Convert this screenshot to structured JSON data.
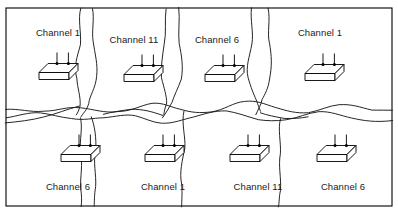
{
  "figure": {
    "frame": {
      "x": 6,
      "y": 8,
      "width": 386,
      "height": 198,
      "stroke_color": "#000000"
    },
    "colors": {
      "line": "#1a1a1a",
      "frame": "#000000",
      "background": "#ffffff",
      "text": "#1a1a1a"
    },
    "icon_name": "wireless-access-point-icon",
    "cells": [
      {
        "id": "cell-top-1",
        "row": "top",
        "column": 1,
        "label": "Channel 1",
        "channel": 1,
        "label_x": 58,
        "label_y": 36,
        "ap_x": 54,
        "ap_y": 76
      },
      {
        "id": "cell-top-2",
        "row": "top",
        "column": 2,
        "label": "Channel 11",
        "channel": 11,
        "label_x": 134,
        "label_y": 43,
        "ap_x": 139,
        "ap_y": 78
      },
      {
        "id": "cell-top-3",
        "row": "top",
        "column": 3,
        "label": "Channel 6",
        "channel": 6,
        "label_x": 217,
        "label_y": 43,
        "ap_x": 220,
        "ap_y": 78
      },
      {
        "id": "cell-top-4",
        "row": "top",
        "column": 4,
        "label": "Channel 1",
        "channel": 1,
        "label_x": 320,
        "label_y": 36,
        "ap_x": 320,
        "ap_y": 77
      },
      {
        "id": "cell-bottom-1",
        "row": "bottom",
        "column": 1,
        "label": "Channel 6",
        "channel": 6,
        "label_x": 68,
        "label_y": 190,
        "ap_x": 76,
        "ap_y": 158
      },
      {
        "id": "cell-bottom-2",
        "row": "bottom",
        "column": 2,
        "label": "Channel 1",
        "channel": 1,
        "label_x": 163,
        "label_y": 190,
        "ap_x": 160,
        "ap_y": 158
      },
      {
        "id": "cell-bottom-3",
        "row": "bottom",
        "column": 3,
        "label": "Channel 11",
        "channel": 11,
        "label_x": 258,
        "label_y": 190,
        "ap_x": 245,
        "ap_y": 158
      },
      {
        "id": "cell-bottom-4",
        "row": "bottom",
        "column": 4,
        "label": "Channel 6",
        "channel": 6,
        "label_x": 343,
        "label_y": 190,
        "ap_x": 332,
        "ap_y": 158
      }
    ],
    "boundaries": [
      {
        "id": "divider-horizontal-main",
        "orientation": "horizontal",
        "path": "M 6 110 C 20 108, 30 112, 44 111 C 58 110, 66 106, 80 108 C 95 110, 104 113, 118 112 C 132 111, 140 105, 152 104 C 163 103, 170 108, 180 110 C 192 112, 200 114, 212 112 C 224 110, 232 103, 244 101 C 256 99, 264 104, 276 107 C 288 110, 296 113, 308 112 C 320 111, 328 106, 340 105 C 352 104, 360 108, 372 110 C 381 111, 387 111, 392 110"
      },
      {
        "id": "divider-horizontal-secondary",
        "orientation": "horizontal",
        "path": "M 6 118 C 18 116, 28 112, 40 113 C 52 114, 60 118, 72 119 C 84 120, 92 118, 104 117 C 116 116, 126 114, 136 116 C 146 118, 152 122, 162 123 C 174 124, 182 120, 194 117 C 206 114, 214 110, 226 111 C 238 112, 246 117, 258 119 C 268 121, 276 122, 286 120 C 298 118, 306 113, 318 112 C 330 111, 340 115, 352 118 C 364 121, 376 122, 392 120"
      },
      {
        "id": "divider-vertical-top-a1",
        "orientation": "vertical",
        "path": "M 80 8 C 78 20, 82 32, 80 44 C 78 56, 74 66, 76 78 C 78 88, 82 96, 80 106 C 79 110, 78 112, 77 115"
      },
      {
        "id": "divider-vertical-top-a2",
        "orientation": "vertical",
        "path": "M 93 8 C 95 20, 91 30, 93 42 C 95 54, 99 64, 97 76 C 95 88, 90 96, 88 104 C 86 110, 83 114, 80 118"
      },
      {
        "id": "divider-vertical-top-b1",
        "orientation": "vertical",
        "path": "M 166 8 C 164 20, 167 32, 165 44 C 163 56, 160 66, 162 78 C 164 88, 167 96, 166 104 C 165 109, 164 112, 163 115"
      },
      {
        "id": "divider-vertical-top-b2",
        "orientation": "vertical",
        "path": "M 178 8 C 180 20, 177 32, 179 44 C 181 56, 184 66, 181 78 C 178 88, 174 96, 171 103 C 169 108, 166 113, 163 117"
      },
      {
        "id": "divider-vertical-top-c1",
        "orientation": "vertical",
        "path": "M 252 8 C 250 20, 253 32, 251 44 C 249 56, 246 66, 248 78 C 250 88, 254 94, 256 100 C 258 105, 259 108, 260 112"
      },
      {
        "id": "divider-vertical-top-c2",
        "orientation": "vertical",
        "path": "M 268 8 C 270 20, 267 32, 269 44 C 271 56, 272 66, 270 78 C 268 88, 264 94, 262 100 C 260 105, 258 110, 255 114"
      },
      {
        "id": "divider-vertical-bottom-a",
        "orientation": "vertical",
        "path": "M 80 118 C 82 128, 79 140, 81 152 C 83 164, 80 176, 81 188 C 82 196, 82 200, 82 206"
      },
      {
        "id": "divider-vertical-bottom-a2",
        "orientation": "vertical",
        "path": "M 92 116 C 94 126, 97 138, 95 150 C 93 162, 96 174, 95 186 C 94 195, 94 200, 94 206"
      },
      {
        "id": "divider-vertical-bottom-b",
        "orientation": "vertical",
        "path": "M 184 112 C 182 124, 186 136, 184 148 C 182 160, 179 172, 181 184 C 182 194, 182 200, 182 206"
      },
      {
        "id": "divider-vertical-bottom-c",
        "orientation": "vertical",
        "path": "M 280 119 C 278 130, 282 142, 280 154 C 278 166, 281 178, 280 190 C 279 198, 279 202, 279 206"
      },
      {
        "id": "branch-top-left-junction",
        "orientation": "diagonal",
        "path": "M 80 106 C 68 110, 56 114, 44 117 C 32 120, 18 122, 6 123"
      },
      {
        "id": "branch-mid-junction",
        "orientation": "diagonal",
        "path": "M 163 115 C 152 112, 142 110, 132 110 C 122 110, 112 112, 104 115"
      },
      {
        "id": "branch-right-junction",
        "orientation": "diagonal",
        "path": "M 260 112 C 268 115, 276 117, 284 118 C 292 119, 300 118, 308 116"
      }
    ]
  }
}
